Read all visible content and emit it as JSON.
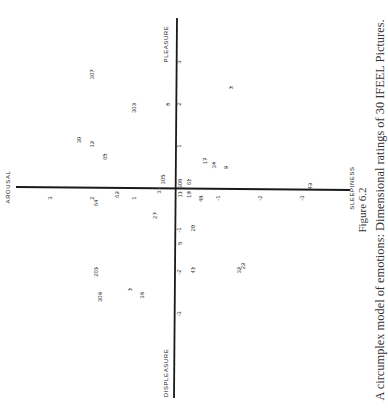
{
  "chart_data": {
    "type": "scatter",
    "orientation": "rotated-90-ccw",
    "title": "A circumplex model of emotions: Dimensional ratings of 30 IFEEL Pictures.",
    "figure_label": "Figure 6.2",
    "axes": {
      "pleasure_axis": {
        "positive_label": "PLEASURE",
        "negative_label": "DISPLEASURE",
        "range": [
          -3.5,
          3.5
        ],
        "ticks": [
          "1",
          "2",
          "3",
          "-1",
          "-2",
          "-3"
        ],
        "tick_values": [
          1,
          2,
          3,
          -1,
          -2,
          -3
        ]
      },
      "arousal_axis": {
        "positive_label": "AROUSAL",
        "negative_label": "SLEEPINESS",
        "range": [
          -3.5,
          3.5
        ],
        "ticks": [
          "1",
          "2",
          "3",
          "-1",
          "-2",
          "-3"
        ],
        "tick_values": [
          1,
          2,
          3,
          -1,
          -2,
          -3
        ]
      }
    },
    "grid": false,
    "legend": "none",
    "points": [
      {
        "label": "307",
        "pleasure": 2.8,
        "arousal": 2.0
      },
      {
        "label": "303",
        "pleasure": 2.0,
        "arousal": 1.0
      },
      {
        "label": "6",
        "pleasure": 2.0,
        "arousal": 0.2
      },
      {
        "label": "3",
        "pleasure": 2.4,
        "arousal": -1.3
      },
      {
        "label": "30",
        "pleasure": 1.2,
        "arousal": 2.3
      },
      {
        "label": "12",
        "pleasure": 1.1,
        "arousal": 2.0
      },
      {
        "label": "65",
        "pleasure": 0.8,
        "arousal": 1.7
      },
      {
        "label": "305",
        "pleasure": 0.3,
        "arousal": 0.3
      },
      {
        "label": "308",
        "pleasure": 0.2,
        "arousal": -0.1
      },
      {
        "label": "61",
        "pleasure": 0.2,
        "arousal": -0.3
      },
      {
        "label": "17",
        "pleasure": 0.7,
        "arousal": -0.7
      },
      {
        "label": "34",
        "pleasure": 0.6,
        "arousal": -0.9
      },
      {
        "label": "9",
        "pleasure": 0.5,
        "arousal": -1.2
      },
      {
        "label": "43",
        "pleasure": 0.1,
        "arousal": -3.2
      },
      {
        "label": "64",
        "pleasure": -0.3,
        "arousal": 1.9
      },
      {
        "label": "62",
        "pleasure": -0.1,
        "arousal": 1.4
      },
      {
        "label": "31",
        "pleasure": 0.0,
        "arousal": 0.4
      },
      {
        "label": "11",
        "pleasure": -0.1,
        "arousal": -0.1
      },
      {
        "label": "19",
        "pleasure": -0.1,
        "arousal": -0.3
      },
      {
        "label": "48",
        "pleasure": -0.2,
        "arousal": -0.6
      },
      {
        "label": "27",
        "pleasure": -0.6,
        "arousal": 0.5
      },
      {
        "label": "20",
        "pleasure": -0.9,
        "arousal": -0.4
      },
      {
        "label": "5",
        "pleasure": -1.3,
        "arousal": -0.1
      },
      {
        "label": "41",
        "pleasure": -1.9,
        "arousal": -0.4
      },
      {
        "label": "32",
        "pleasure": -1.9,
        "arousal": -1.5
      },
      {
        "label": "22",
        "pleasure": -1.8,
        "arousal": -1.6
      },
      {
        "label": "201",
        "pleasure": -1.9,
        "arousal": 1.9
      },
      {
        "label": "1",
        "pleasure": -2.4,
        "arousal": 1.1
      },
      {
        "label": "36",
        "pleasure": -2.5,
        "arousal": 0.8
      },
      {
        "label": "306",
        "pleasure": -2.5,
        "arousal": 1.8
      }
    ]
  }
}
